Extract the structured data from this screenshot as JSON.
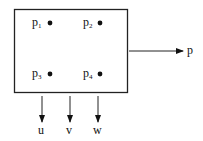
{
  "diagram": {
    "points": [
      {
        "base": "p",
        "sub": "1"
      },
      {
        "base": "p",
        "sub": "2"
      },
      {
        "base": "p",
        "sub": "3"
      },
      {
        "base": "p",
        "sub": "4"
      }
    ],
    "output_label": "p",
    "bottom_labels": [
      "u",
      "v",
      "w"
    ]
  }
}
